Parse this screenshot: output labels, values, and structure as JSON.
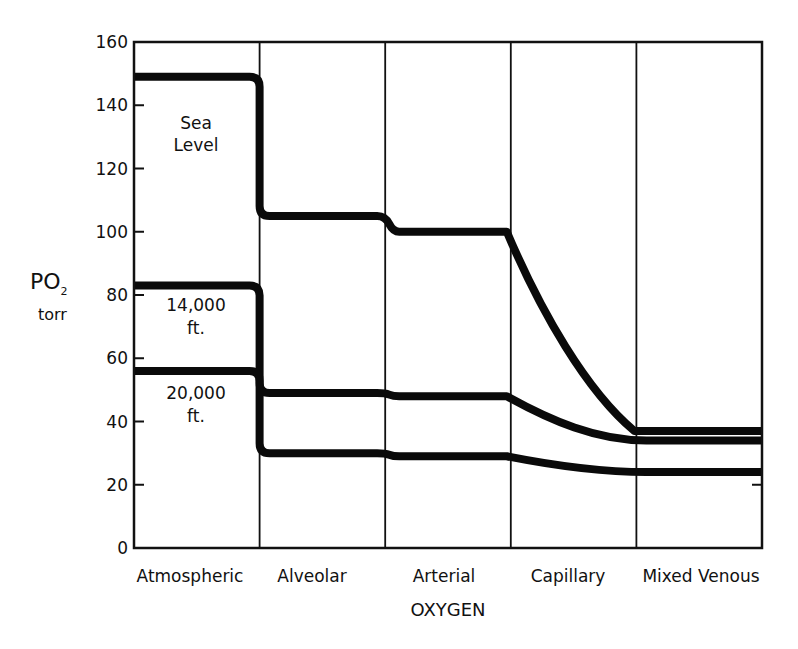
{
  "chart_data": {
    "type": "line",
    "title": "",
    "xlabel": "OXYGEN",
    "ylabel": "PO2",
    "ylabel_unit": "torr",
    "ylim": [
      0,
      160
    ],
    "yticks": [
      0,
      20,
      40,
      60,
      80,
      100,
      120,
      140,
      160
    ],
    "grid": "vertical category dividers",
    "categories": [
      "Atmospheric",
      "Alveolar",
      "Arterial",
      "Capillary",
      "Mixed Venous"
    ],
    "series": [
      {
        "name": "Sea Level",
        "label_lines": [
          "Sea",
          "Level"
        ],
        "values": {
          "Atmospheric": 149,
          "Alveolar": 105,
          "Arterial": 100,
          "Capillary": "100 → 37 (declining curve)",
          "Mixed Venous": 37
        }
      },
      {
        "name": "14,000 ft.",
        "label_lines": [
          "14,000",
          "ft."
        ],
        "values": {
          "Atmospheric": 83,
          "Alveolar": 49,
          "Arterial": 48,
          "Capillary": "48 → 34 (declining curve)",
          "Mixed Venous": 34
        }
      },
      {
        "name": "20,000 ft.",
        "label_lines": [
          "20,000",
          "ft."
        ],
        "values": {
          "Atmospheric": 56,
          "Alveolar": 30,
          "Arterial": 29,
          "Capillary": "29 → 24 (declining curve)",
          "Mixed Venous": 24
        }
      }
    ]
  },
  "axis": {
    "y_label_main": "PO",
    "y_label_sub": "2",
    "y_label_unit": "torr",
    "x_label": "OXYGEN"
  }
}
